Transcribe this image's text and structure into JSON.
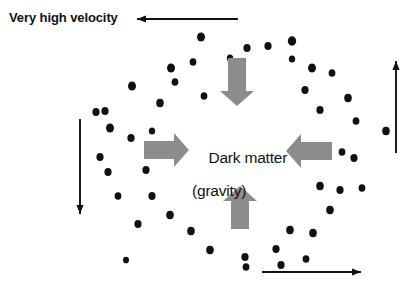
{
  "diagram": {
    "background_color": "#ffffff",
    "dot_color": "#111111",
    "gray_arrow_color": "#8c8c8c",
    "black_arrow_color": "#111111",
    "labels": {
      "velocity": "Very high velocity",
      "center_line1": "Dark matter",
      "center_line2": "(gravity)"
    },
    "gravity_arrows": [
      {
        "name": "gravity-arrow-down",
        "direction": "down",
        "x1": 237,
        "y1": 58,
        "x2": 237,
        "y2": 106
      },
      {
        "name": "gravity-arrow-right",
        "direction": "right",
        "x1": 144,
        "y1": 150,
        "x2": 189,
        "y2": 150
      },
      {
        "name": "gravity-arrow-left",
        "direction": "left",
        "x1": 332,
        "y1": 151,
        "x2": 286,
        "y2": 151
      },
      {
        "name": "gravity-arrow-up",
        "direction": "up",
        "x1": 240,
        "y1": 229,
        "x2": 240,
        "y2": 186
      }
    ],
    "velocity_arrows": [
      {
        "name": "velocity-arrow-top",
        "direction": "left",
        "x1": 238,
        "y1": 19,
        "x2": 137,
        "y2": 19
      },
      {
        "name": "velocity-arrow-right",
        "direction": "up",
        "x1": 396,
        "y1": 153,
        "x2": 396,
        "y2": 61
      },
      {
        "name": "velocity-arrow-left",
        "direction": "down",
        "x1": 80,
        "y1": 119,
        "x2": 80,
        "y2": 214
      },
      {
        "name": "velocity-arrow-bottom",
        "direction": "right",
        "x1": 262,
        "y1": 272,
        "x2": 361,
        "y2": 272
      }
    ],
    "stars": [
      {
        "x": 201,
        "y": 37,
        "r": 4.0
      },
      {
        "x": 247,
        "y": 48,
        "r": 3.6
      },
      {
        "x": 268,
        "y": 46,
        "r": 3.6
      },
      {
        "x": 292,
        "y": 41,
        "r": 4.2
      },
      {
        "x": 171,
        "y": 68,
        "r": 4.0
      },
      {
        "x": 193,
        "y": 62,
        "r": 3.4
      },
      {
        "x": 230,
        "y": 58,
        "r": 3.2
      },
      {
        "x": 292,
        "y": 59,
        "r": 3.2
      },
      {
        "x": 312,
        "y": 68,
        "r": 4.0
      },
      {
        "x": 332,
        "y": 73,
        "r": 3.4
      },
      {
        "x": 132,
        "y": 86,
        "r": 4.0
      },
      {
        "x": 175,
        "y": 82,
        "r": 3.4
      },
      {
        "x": 305,
        "y": 90,
        "r": 3.6
      },
      {
        "x": 348,
        "y": 98,
        "r": 3.8
      },
      {
        "x": 160,
        "y": 103,
        "r": 3.8
      },
      {
        "x": 204,
        "y": 96,
        "r": 3.4
      },
      {
        "x": 320,
        "y": 110,
        "r": 3.6
      },
      {
        "x": 96,
        "y": 112,
        "r": 3.6
      },
      {
        "x": 105,
        "y": 111,
        "r": 3.6
      },
      {
        "x": 110,
        "y": 128,
        "r": 4.0
      },
      {
        "x": 131,
        "y": 138,
        "r": 3.6
      },
      {
        "x": 356,
        "y": 121,
        "r": 3.4
      },
      {
        "x": 386,
        "y": 131,
        "r": 3.8
      },
      {
        "x": 152,
        "y": 131,
        "r": 3.2
      },
      {
        "x": 100,
        "y": 157,
        "r": 3.6
      },
      {
        "x": 108,
        "y": 172,
        "r": 3.6
      },
      {
        "x": 354,
        "y": 158,
        "r": 3.6
      },
      {
        "x": 146,
        "y": 170,
        "r": 3.6
      },
      {
        "x": 317,
        "y": 150,
        "r": 3.6
      },
      {
        "x": 342,
        "y": 152,
        "r": 3.4
      },
      {
        "x": 152,
        "y": 196,
        "r": 3.6
      },
      {
        "x": 118,
        "y": 196,
        "r": 3.4
      },
      {
        "x": 320,
        "y": 186,
        "r": 3.8
      },
      {
        "x": 340,
        "y": 190,
        "r": 3.6
      },
      {
        "x": 362,
        "y": 188,
        "r": 3.4
      },
      {
        "x": 170,
        "y": 215,
        "r": 3.8
      },
      {
        "x": 138,
        "y": 224,
        "r": 3.6
      },
      {
        "x": 330,
        "y": 210,
        "r": 3.8
      },
      {
        "x": 290,
        "y": 230,
        "r": 3.8
      },
      {
        "x": 191,
        "y": 231,
        "r": 3.8
      },
      {
        "x": 210,
        "y": 250,
        "r": 3.8
      },
      {
        "x": 245,
        "y": 257,
        "r": 3.6
      },
      {
        "x": 313,
        "y": 233,
        "r": 3.8
      },
      {
        "x": 276,
        "y": 249,
        "r": 3.6
      },
      {
        "x": 246,
        "y": 267,
        "r": 3.4
      },
      {
        "x": 281,
        "y": 265,
        "r": 3.6
      },
      {
        "x": 306,
        "y": 259,
        "r": 3.4
      },
      {
        "x": 126,
        "y": 260,
        "r": 3.0
      }
    ]
  }
}
